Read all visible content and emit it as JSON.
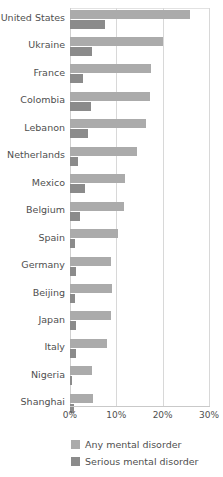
{
  "chart_data": {
    "type": "bar",
    "orientation": "horizontal",
    "title": "",
    "xlabel": "",
    "ylabel": "",
    "xlim": [
      0,
      30
    ],
    "xticks": [
      0,
      10,
      20,
      30
    ],
    "xtick_labels": [
      "0%",
      "10%",
      "20%",
      "30%"
    ],
    "grid": "vertical",
    "legend_position": "bottom",
    "categories": [
      "United States",
      "Ukraine",
      "France",
      "Colombia",
      "Lebanon",
      "Netherlands",
      "Mexico",
      "Belgium",
      "Spain",
      "Germany",
      "Beijing",
      "Japan",
      "Italy",
      "Nigeria",
      "Shanghai"
    ],
    "series": [
      {
        "name": "Any mental disorder",
        "color": "#ababab",
        "values": [
          26.0,
          20.0,
          17.5,
          17.2,
          16.4,
          14.4,
          11.8,
          11.6,
          10.3,
          8.8,
          9.1,
          8.8,
          8.0,
          4.7,
          4.9
        ]
      },
      {
        "name": "Serious mental disorder",
        "color": "#8b8b8b",
        "values": [
          7.5,
          4.8,
          2.8,
          4.5,
          3.9,
          1.8,
          3.2,
          2.2,
          1.0,
          1.2,
          1.0,
          1.3,
          1.3,
          0.4,
          0.9
        ]
      }
    ]
  },
  "legend": {
    "items": [
      {
        "label": "Any mental disorder",
        "swatch": "any"
      },
      {
        "label": "Serious mental disorder",
        "swatch": "serious"
      }
    ]
  }
}
